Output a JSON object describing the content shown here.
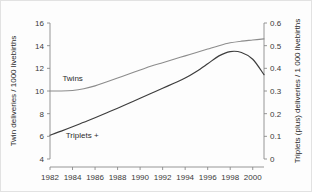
{
  "chart_data": {
    "type": "line",
    "title": "",
    "xlabel": "",
    "ylabel": "Twin deliveries / 1000 livebirths",
    "y2label": "Triplets (plus) deliveries / 1 000 livebirths",
    "grid": false,
    "legend_position": "inline-annotation",
    "xlim": [
      1982,
      2001
    ],
    "ylim": [
      4,
      16
    ],
    "y2lim": [
      0,
      0.6
    ],
    "xticks": [
      1982,
      1984,
      1986,
      1988,
      1990,
      1992,
      1994,
      1996,
      1998,
      2000
    ],
    "xticklabels": [
      "1982",
      "1984",
      "1986",
      "1988",
      "1990",
      "1992",
      "1994",
      "1996",
      "1998",
      "2000"
    ],
    "yticks": [
      4,
      6,
      8,
      10,
      12,
      14,
      16
    ],
    "yticklabels": [
      "4",
      "6",
      "8",
      "10",
      "12",
      "14",
      "16"
    ],
    "y2ticks": [
      0,
      0.1,
      0.2,
      0.3,
      0.4,
      0.5,
      0.6
    ],
    "y2ticklabels": [
      "0",
      "0.1",
      "0.2",
      "0.3",
      "0.4",
      "0.5",
      "0.6"
    ],
    "x": [
      1982,
      1983,
      1984,
      1985,
      1986,
      1987,
      1988,
      1989,
      1990,
      1991,
      1992,
      1993,
      1994,
      1995,
      1996,
      1997,
      1998,
      1999,
      2000,
      2001
    ],
    "series": [
      {
        "name": "Twins",
        "axis": "left",
        "color": "#8c8c8c",
        "label_x": 1983.1,
        "label_y": 10.85,
        "values": [
          10.0,
          10.0,
          10.05,
          10.2,
          10.45,
          10.8,
          11.15,
          11.5,
          11.85,
          12.2,
          12.5,
          12.8,
          13.1,
          13.4,
          13.7,
          14.0,
          14.25,
          14.4,
          14.5,
          14.6
        ]
      },
      {
        "name": "Triplets +",
        "axis": "right",
        "color": "#3d3d3d",
        "label_x": 1983.4,
        "label_y": 5.85,
        "values": [
          0.105,
          0.123,
          0.142,
          0.162,
          0.182,
          0.203,
          0.224,
          0.246,
          0.268,
          0.29,
          0.312,
          0.334,
          0.357,
          0.386,
          0.42,
          0.455,
          0.474,
          0.47,
          0.44,
          0.372
        ]
      }
    ]
  },
  "axes": {
    "left_title": "Twin deliveries / 1000 livebirths",
    "right_title": "Triplets (plus) deliveries / 1 000 livebirths"
  }
}
